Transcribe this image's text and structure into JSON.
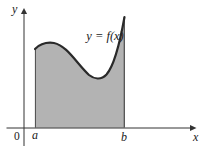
{
  "figure": {
    "curve_label": "y = f(x)",
    "axis_labels": {
      "x": "x",
      "y": "y"
    },
    "tick_labels": {
      "origin": "0",
      "a": "a",
      "b": "b"
    },
    "colors": {
      "region_fill": "#b3b3b3",
      "curve_stroke": "#2a2a2a",
      "region_edge_stroke": "#4a4a4a",
      "axis_stroke": "#333333",
      "label_color": "#1a1a1a",
      "background": "#ffffff"
    },
    "geometry": {
      "curve_path": "M 35 49 C 40 44 47 42 54 43 C 67 45.5 77 64 89 75 C 94 79 101 80.5 106.5 74.5 C 113 67 119.5 45 124.5 17",
      "region_path": "M 35 49 C 40 44 47 42 54 43 C 67 45.5 77 64 89 75 C 94 79 101 80.5 106.5 74.5 C 113 67 119.5 45 124.5 17 L 124.5 127.8 L 35 127.8 Z"
    }
  }
}
